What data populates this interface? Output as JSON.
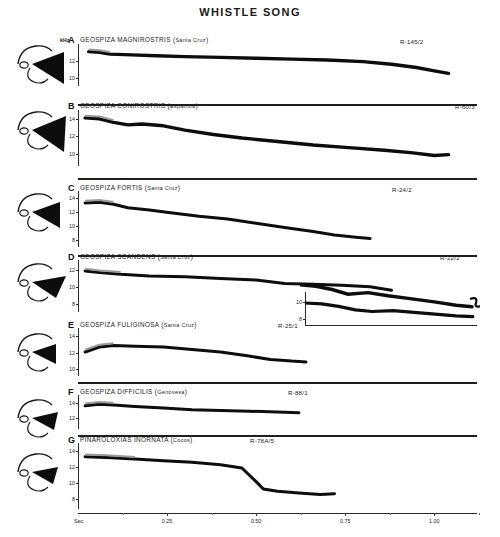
{
  "figure": {
    "title": "WHISTLE SONG",
    "time_axis": {
      "unit_label": "Sec.",
      "ticks": [
        "0.25",
        "0.50",
        "0.75",
        "1.00"
      ],
      "tick_values": [
        0.25,
        0.5,
        0.75,
        1.0
      ],
      "range": [
        0,
        1.12
      ]
    },
    "frequency_unit": "kHz"
  },
  "panels": [
    {
      "letter": "A",
      "species": "GEOSPIZA MAGNIROSTRIS",
      "locality": "Santa Cruz",
      "code": "R-145/2",
      "y_ticks": [
        "12",
        "10"
      ],
      "y_tick_values": [
        12,
        10
      ],
      "y_range": [
        9,
        14
      ],
      "show_khz": true,
      "bird": "large-ground-finch-head"
    },
    {
      "letter": "B",
      "species": "GEOSPIZA CONIROSTRIS",
      "locality": "Española",
      "code": "R-60/3",
      "y_ticks": [
        "14",
        "12",
        "10"
      ],
      "y_tick_values": [
        14,
        12,
        10
      ],
      "y_range": [
        8.6,
        15
      ],
      "show_khz": false,
      "bird": "large-cactus-finch-head"
    },
    {
      "letter": "C",
      "species": "GEOSPIZA FORTIS",
      "locality": "Santa Cruz",
      "code": "R-24/2",
      "y_ticks": [
        "14",
        "12",
        "10",
        "8"
      ],
      "y_tick_values": [
        14,
        12,
        10,
        8
      ],
      "y_range": [
        7,
        15
      ],
      "show_khz": false,
      "bird": "medium-ground-finch-head"
    },
    {
      "letter": "D",
      "species": "GEOSPIZA SCANDENS",
      "locality": "Santa Cruz",
      "code": "R-22/2",
      "y_ticks": [
        "12",
        "10",
        "8"
      ],
      "y_tick_values": [
        12,
        10,
        8
      ],
      "y_range": [
        7,
        13.2
      ],
      "show_khz": false,
      "bird": "cactus-finch-head"
    },
    {
      "letter": "E",
      "species": "GEOSPIZA FULIGINOSA",
      "locality": "Santa Cruz",
      "code": "R-25/1",
      "y_ticks": [
        "14",
        "12",
        "10"
      ],
      "y_tick_values": [
        14,
        12,
        10
      ],
      "y_range": [
        9.2,
        15
      ],
      "show_khz": false,
      "bird": "small-ground-finch-head"
    },
    {
      "letter": "F",
      "species": "GEOSPIZA DIFFICILIS",
      "locality": "Genovesa",
      "code": "R-88/1",
      "y_ticks": [
        "14",
        "12"
      ],
      "y_tick_values": [
        14,
        12
      ],
      "y_range": [
        10.6,
        15
      ],
      "show_khz": false,
      "bird": "sharp-beaked-ground-finch-head"
    },
    {
      "letter": "G",
      "species": "PINAROLOXIAS INORNATA",
      "locality": "Cocos",
      "code": "R-78A/5",
      "y_ticks": [
        "14",
        "12",
        "10",
        "8"
      ],
      "y_tick_values": [
        14,
        12,
        10,
        8
      ],
      "y_range": [
        6.8,
        15
      ],
      "show_khz": false,
      "bird": "cocos-finch-head"
    }
  ],
  "inset": {
    "y_ticks": [
      "10",
      "8"
    ],
    "y_tick_values": [
      10,
      8
    ],
    "y_range": [
      7.2,
      11.2
    ]
  },
  "chart_data": {
    "type": "line",
    "title": "WHISTLE SONG",
    "xlabel": "Sec.",
    "ylabel": "kHz",
    "xlim": [
      0,
      1.12
    ],
    "grid": false,
    "legend": "none",
    "series": [
      {
        "name": "A GEOSPIZA MAGNIROSTRIS (Santa Cruz) R-145/2",
        "x": [
          0.03,
          0.06,
          0.09,
          0.15,
          0.22,
          0.3,
          0.4,
          0.5,
          0.6,
          0.7,
          0.8,
          0.88,
          0.95,
          1.0,
          1.04
        ],
        "y": [
          13.1,
          13.0,
          12.8,
          12.7,
          12.6,
          12.5,
          12.4,
          12.3,
          12.2,
          12.1,
          11.9,
          11.6,
          11.2,
          10.8,
          10.5
        ]
      },
      {
        "name": "B GEOSPIZA CONIROSTRIS (Española) R-60/3",
        "x": [
          0.02,
          0.06,
          0.1,
          0.14,
          0.18,
          0.24,
          0.3,
          0.38,
          0.46,
          0.56,
          0.66,
          0.76,
          0.86,
          0.94,
          1.0,
          1.04
        ],
        "y": [
          14.1,
          14.0,
          13.6,
          13.3,
          13.4,
          13.2,
          12.7,
          12.2,
          11.8,
          11.4,
          11.0,
          10.7,
          10.4,
          10.1,
          9.8,
          9.9
        ]
      },
      {
        "name": "C GEOSPIZA FORTIS (Santa Cruz) R-24/2",
        "x": [
          0.02,
          0.06,
          0.1,
          0.14,
          0.2,
          0.26,
          0.34,
          0.42,
          0.5,
          0.58,
          0.66,
          0.72,
          0.78,
          0.82
        ],
        "y": [
          13.3,
          13.4,
          13.1,
          12.6,
          12.3,
          11.9,
          11.4,
          11.0,
          10.4,
          9.8,
          9.2,
          8.7,
          8.4,
          8.2
        ]
      },
      {
        "name": "D GEOSPIZA SCANDENS (Santa Cruz) R-22/2",
        "x": [
          0.02,
          0.06,
          0.12,
          0.2,
          0.3,
          0.4,
          0.5,
          0.58,
          0.66,
          0.74,
          0.82,
          0.88
        ],
        "y": [
          11.9,
          11.7,
          11.5,
          11.3,
          11.2,
          11.0,
          10.8,
          10.4,
          10.3,
          10.2,
          10.0,
          9.6
        ]
      },
      {
        "name": "D-inset continuation",
        "x": [
          0.0,
          0.08,
          0.16,
          0.24,
          0.32,
          0.42,
          0.52,
          0.62,
          0.72,
          0.8
        ],
        "y": [
          9.9,
          9.8,
          9.5,
          9.1,
          8.9,
          9.0,
          8.8,
          8.6,
          8.4,
          8.3
        ]
      },
      {
        "name": "E GEOSPIZA FULIGINOSA (Santa Cruz) R-25/1",
        "x": [
          0.02,
          0.06,
          0.1,
          0.16,
          0.24,
          0.32,
          0.4,
          0.48,
          0.54,
          0.6,
          0.64
        ],
        "y": [
          12.1,
          12.7,
          12.9,
          12.8,
          12.7,
          12.4,
          12.1,
          11.6,
          11.2,
          11.0,
          10.9
        ]
      },
      {
        "name": "E-inset upper",
        "x": [
          0.0,
          0.08,
          0.16,
          0.24,
          0.34,
          0.44,
          0.56,
          0.68,
          0.78,
          0.86
        ],
        "y": [
          10.9,
          10.8,
          10.6,
          10.3,
          10.4,
          10.2,
          10.0,
          9.8,
          9.6,
          9.5
        ]
      },
      {
        "name": "F GEOSPIZA DIFFICILIS (Genovesa) R-88/1",
        "x": [
          0.02,
          0.06,
          0.1,
          0.16,
          0.24,
          0.32,
          0.4,
          0.48,
          0.56,
          0.62
        ],
        "y": [
          13.6,
          13.8,
          13.7,
          13.5,
          13.3,
          13.1,
          13.0,
          12.9,
          12.8,
          12.7
        ]
      },
      {
        "name": "G PINAROLOXIAS INORNATA (Cocos) R-78A/5",
        "x": [
          0.02,
          0.08,
          0.16,
          0.24,
          0.32,
          0.4,
          0.46,
          0.5,
          0.52,
          0.56,
          0.62,
          0.68,
          0.72
        ],
        "y": [
          13.3,
          13.2,
          13.0,
          12.8,
          12.6,
          12.3,
          11.9,
          10.2,
          9.3,
          9.0,
          8.8,
          8.6,
          8.7
        ]
      }
    ]
  }
}
